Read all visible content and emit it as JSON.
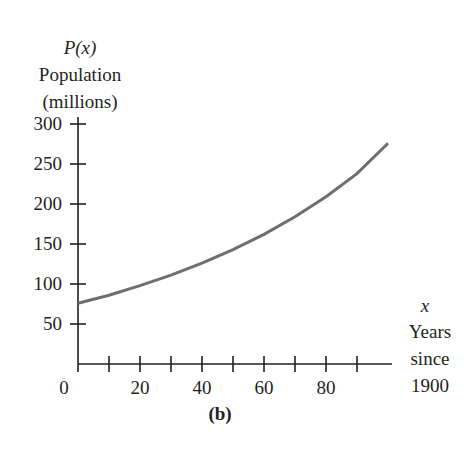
{
  "chart_data": {
    "type": "line",
    "title": "",
    "panel_label": "(b)",
    "ylabel_lines": [
      "P(x)",
      "Population",
      "(millions)"
    ],
    "xlabel_lines": [
      "x",
      "Years",
      "since",
      "1900"
    ],
    "y_ticks": [
      50,
      100,
      150,
      200,
      250,
      300
    ],
    "y_tick_labels": [
      "50",
      "100",
      "150",
      "200",
      "250",
      "300"
    ],
    "x_ticks": [
      10,
      20,
      30,
      40,
      50,
      60,
      70,
      80,
      90
    ],
    "x_tick_labels": [
      "0",
      "20",
      "40",
      "60",
      "80"
    ],
    "xlim": [
      0,
      100
    ],
    "ylim": [
      0,
      300
    ],
    "grid": false,
    "series": [
      {
        "name": "P(x)",
        "x": [
          0,
          10,
          20,
          30,
          40,
          50,
          60,
          70,
          80,
          90,
          100
        ],
        "values": [
          76,
          86,
          98,
          111,
          126,
          143,
          162,
          184,
          209,
          238,
          276
        ],
        "color": "#6d6e70"
      }
    ]
  },
  "labels": {
    "y_var": "P(x)",
    "y_name": "Population",
    "y_unit": "(millions)",
    "x_var": "x",
    "x_name1": "Years",
    "x_name2": "since",
    "x_name3": "1900",
    "origin": "0",
    "panel": "(b)"
  },
  "colors": {
    "axis": "#231f20",
    "curve": "#6d6e70"
  }
}
